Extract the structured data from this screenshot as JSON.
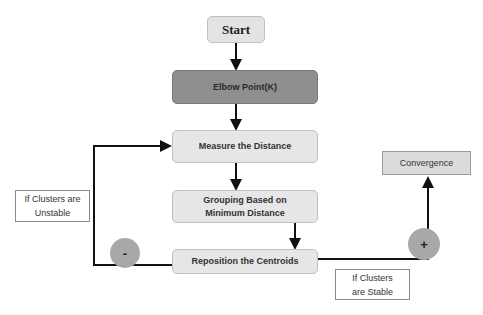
{
  "diagram": {
    "nodes": {
      "start": "Start",
      "elbow": "Elbow Point(K)",
      "measure": "Measure the Distance",
      "grouping": "Grouping Based on Minimum Distance",
      "reposition": "Reposition the Centroids",
      "convergence": "Convergence"
    },
    "labels": {
      "unstable": "If Clusters are Unstable",
      "stable": "If Clusters are Stable"
    },
    "signs": {
      "minus": "-",
      "plus": "+"
    },
    "colors": {
      "box_fill": "#e6e6e6",
      "elbow_fill": "#8f8f8f",
      "circle_fill": "#a8a8a8",
      "line": "#111111"
    }
  }
}
